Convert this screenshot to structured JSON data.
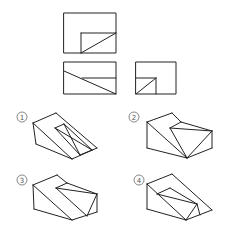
{
  "diagram": {
    "type": "orthographic-projection-question",
    "stroke_color": "#222222",
    "label_color": "#555555",
    "views": {
      "top": {
        "outer": [
          64,
          13,
          116,
          53
        ],
        "lines": [
          [
            81,
            33,
            116,
            33
          ],
          [
            81,
            33,
            81,
            53
          ],
          [
            81,
            53,
            116,
            33
          ]
        ]
      },
      "front": {
        "outer": [
          64,
          62,
          116,
          94
        ],
        "lines": [
          [
            82,
            78,
            116,
            78
          ],
          [
            64,
            71,
            116,
            94
          ]
        ]
      },
      "side": {
        "outer": [
          136,
          62,
          176,
          94
        ],
        "lines": [
          [
            136,
            78,
            156,
            78
          ],
          [
            156,
            78,
            156,
            94
          ],
          [
            136,
            94,
            156,
            78
          ]
        ]
      }
    },
    "options": [
      {
        "label": "1",
        "symbol": "①",
        "label_pos": [
          22,
          117
        ],
        "lines": [
          [
            33,
            123,
            56,
            113
          ],
          [
            56,
            113,
            97,
            148
          ],
          [
            33,
            123,
            36,
            144
          ],
          [
            36,
            144,
            72,
            159
          ],
          [
            72,
            159,
            97,
            148
          ],
          [
            33,
            123,
            72,
            159
          ],
          [
            55,
            128,
            64,
            124
          ],
          [
            55,
            128,
            80,
            155
          ],
          [
            64,
            124,
            92,
            150
          ],
          [
            55,
            128,
            92,
            150
          ],
          [
            64,
            124,
            80,
            155
          ],
          [
            80,
            155,
            92,
            150
          ]
        ]
      },
      {
        "label": "2",
        "symbol": "②",
        "label_pos": [
          134,
          117
        ],
        "lines": [
          [
            147,
            122,
            172,
            113
          ],
          [
            172,
            113,
            181,
            122
          ],
          [
            181,
            122,
            212,
            131
          ],
          [
            147,
            122,
            147,
            148
          ],
          [
            147,
            148,
            187,
            158
          ],
          [
            187,
            158,
            212,
            148
          ],
          [
            212,
            148,
            212,
            131
          ],
          [
            147,
            122,
            187,
            158
          ],
          [
            170,
            128,
            181,
            122
          ],
          [
            170,
            128,
            187,
            158
          ],
          [
            170,
            128,
            212,
            131
          ],
          [
            212,
            131,
            187,
            158
          ]
        ]
      },
      {
        "label": "3",
        "symbol": "③",
        "label_pos": [
          22,
          180
        ],
        "lines": [
          [
            33,
            185,
            57,
            175
          ],
          [
            57,
            175,
            67,
            183
          ],
          [
            67,
            183,
            97,
            194
          ],
          [
            33,
            185,
            34,
            209
          ],
          [
            34,
            209,
            72,
            220
          ],
          [
            72,
            220,
            97,
            212
          ],
          [
            97,
            212,
            97,
            194
          ],
          [
            33,
            185,
            72,
            220
          ],
          [
            56,
            188,
            67,
            183
          ],
          [
            56,
            188,
            97,
            194
          ],
          [
            56,
            188,
            87,
            216
          ],
          [
            97,
            194,
            87,
            216
          ]
        ]
      },
      {
        "label": "4",
        "symbol": "④",
        "label_pos": [
          139,
          180
        ],
        "lines": [
          [
            147,
            184,
            172,
            174
          ],
          [
            172,
            174,
            212,
            210
          ],
          [
            147,
            184,
            147,
            209
          ],
          [
            147,
            209,
            186,
            220
          ],
          [
            186,
            220,
            212,
            210
          ],
          [
            147,
            184,
            186,
            220
          ],
          [
            157,
            194,
            170,
            188
          ],
          [
            170,
            188,
            197,
            204
          ],
          [
            157,
            194,
            197,
            204
          ],
          [
            197,
            204,
            200,
            215
          ],
          [
            197,
            204,
            186,
            220
          ]
        ]
      }
    ]
  }
}
